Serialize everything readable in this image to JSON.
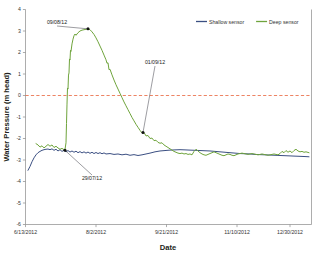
{
  "chart_data": {
    "type": "line",
    "title": "",
    "xlabel": "Date",
    "ylabel": "Water Pressure (m head)",
    "xlim": [
      "6/13/2012",
      "1/18/2013"
    ],
    "ylim": [
      -6,
      4
    ],
    "ytick_step": 1,
    "grid": false,
    "legend_position": "top-right",
    "x_ticks": [
      "6/13/2012",
      "8/2/2012",
      "9/21/2012",
      "11/10/2012",
      "12/30/2012"
    ],
    "y_ticks": [
      "4",
      "3",
      "2",
      "1",
      "0",
      "-1",
      "-2",
      "-3",
      "-4",
      "-5",
      "-6"
    ],
    "reference_lines": [
      {
        "name": "zero-line",
        "axis": "y",
        "value": 0,
        "style": "dashed",
        "color": "#e8643c"
      }
    ],
    "series": [
      {
        "name": "Shallow sensor",
        "color": "#3b4f82",
        "points": [
          [
            28,
            -3.48
          ],
          [
            30,
            -3.3
          ],
          [
            32,
            -3.08
          ],
          [
            34,
            -2.9
          ],
          [
            36,
            -2.76
          ],
          [
            38,
            -2.66
          ],
          [
            40,
            -2.6
          ],
          [
            42,
            -2.55
          ],
          [
            44,
            -2.52
          ],
          [
            46,
            -2.5
          ],
          [
            48,
            -2.49
          ],
          [
            50,
            -2.52
          ],
          [
            52,
            -2.48
          ],
          [
            54,
            -2.55
          ],
          [
            56,
            -2.5
          ],
          [
            58,
            -2.58
          ],
          [
            60,
            -2.52
          ],
          [
            62,
            -2.6
          ],
          [
            64,
            -2.55
          ],
          [
            66,
            -2.62
          ],
          [
            68,
            -2.56
          ],
          [
            70,
            -2.63
          ],
          [
            72,
            -2.58
          ],
          [
            74,
            -2.64
          ],
          [
            76,
            -2.59
          ],
          [
            78,
            -2.66
          ],
          [
            80,
            -2.61
          ],
          [
            82,
            -2.67
          ],
          [
            84,
            -2.62
          ],
          [
            86,
            -2.68
          ],
          [
            88,
            -2.63
          ],
          [
            90,
            -2.69
          ],
          [
            92,
            -2.64
          ],
          [
            94,
            -2.7
          ],
          [
            96,
            -2.65
          ],
          [
            98,
            -2.7
          ],
          [
            100,
            -2.66
          ],
          [
            102,
            -2.71
          ],
          [
            104,
            -2.67
          ],
          [
            106,
            -2.72
          ],
          [
            110,
            -2.7
          ],
          [
            114,
            -2.74
          ],
          [
            118,
            -2.72
          ],
          [
            122,
            -2.76
          ],
          [
            126,
            -2.73
          ],
          [
            130,
            -2.78
          ],
          [
            134,
            -2.75
          ],
          [
            138,
            -2.79
          ],
          [
            142,
            -2.76
          ],
          [
            146,
            -2.72
          ],
          [
            150,
            -2.68
          ],
          [
            155,
            -2.62
          ],
          [
            160,
            -2.58
          ],
          [
            165,
            -2.56
          ],
          [
            170,
            -2.54
          ],
          [
            175,
            -2.53
          ],
          [
            180,
            -2.52
          ],
          [
            185,
            -2.53
          ],
          [
            190,
            -2.54
          ],
          [
            195,
            -2.55
          ],
          [
            200,
            -2.56
          ],
          [
            205,
            -2.57
          ],
          [
            210,
            -2.58
          ],
          [
            215,
            -2.6
          ],
          [
            220,
            -2.62
          ],
          [
            225,
            -2.64
          ],
          [
            230,
            -2.66
          ],
          [
            235,
            -2.68
          ],
          [
            240,
            -2.7
          ],
          [
            245,
            -2.71
          ],
          [
            250,
            -2.72
          ],
          [
            255,
            -2.74
          ],
          [
            260,
            -2.75
          ],
          [
            265,
            -2.76
          ],
          [
            270,
            -2.77
          ],
          [
            275,
            -2.78
          ],
          [
            280,
            -2.79
          ],
          [
            285,
            -2.8
          ],
          [
            290,
            -2.81
          ],
          [
            295,
            -2.82
          ],
          [
            300,
            -2.83
          ],
          [
            305,
            -2.84
          ],
          [
            309,
            -2.85
          ]
        ]
      },
      {
        "name": "Deep sensor",
        "color": "#6fa43c",
        "points": [
          [
            36,
            -2.24
          ],
          [
            38,
            -2.3
          ],
          [
            40,
            -2.4
          ],
          [
            42,
            -2.34
          ],
          [
            44,
            -2.44
          ],
          [
            46,
            -2.36
          ],
          [
            48,
            -2.28
          ],
          [
            50,
            -2.36
          ],
          [
            52,
            -2.3
          ],
          [
            54,
            -2.42
          ],
          [
            56,
            -2.36
          ],
          [
            58,
            -2.44
          ],
          [
            60,
            -2.5
          ],
          [
            62,
            -2.46
          ],
          [
            64,
            -2.52
          ],
          [
            65,
            -2.5
          ],
          [
            66,
            -2.2
          ],
          [
            66.5,
            -1.3
          ],
          [
            67,
            -0.4
          ],
          [
            67.5,
            0.35
          ],
          [
            68,
            0.3
          ],
          [
            68.5,
            0.95
          ],
          [
            69,
            1.05
          ],
          [
            69.5,
            1.7
          ],
          [
            70,
            1.65
          ],
          [
            70.5,
            2.1
          ],
          [
            71,
            2.05
          ],
          [
            72,
            2.4
          ],
          [
            73,
            2.62
          ],
          [
            74,
            2.78
          ],
          [
            75,
            2.86
          ],
          [
            76,
            2.8
          ],
          [
            78,
            2.92
          ],
          [
            80,
            3.0
          ],
          [
            82,
            3.04
          ],
          [
            84,
            3.06
          ],
          [
            86,
            3.08
          ],
          [
            88,
            3.1
          ],
          [
            90,
            3.06
          ],
          [
            92,
            2.96
          ],
          [
            94,
            2.84
          ],
          [
            96,
            2.68
          ],
          [
            98,
            2.5
          ],
          [
            100,
            2.3
          ],
          [
            102,
            2.1
          ],
          [
            104,
            1.88
          ],
          [
            106,
            1.66
          ],
          [
            107,
            1.5
          ],
          [
            108,
            1.52
          ],
          [
            109,
            1.2
          ],
          [
            110,
            1.22
          ],
          [
            112,
            0.96
          ],
          [
            114,
            0.72
          ],
          [
            116,
            0.5
          ],
          [
            118,
            0.3
          ],
          [
            120,
            0.1
          ],
          [
            122,
            -0.1
          ],
          [
            124,
            -0.3
          ],
          [
            126,
            -0.48
          ],
          [
            128,
            -0.66
          ],
          [
            130,
            -0.84
          ],
          [
            132,
            -1.02
          ],
          [
            134,
            -1.18
          ],
          [
            136,
            -1.34
          ],
          [
            138,
            -1.48
          ],
          [
            140,
            -1.62
          ],
          [
            142,
            -1.74
          ],
          [
            144,
            -1.72
          ],
          [
            146,
            -1.88
          ],
          [
            148,
            -1.86
          ],
          [
            150,
            -2.0
          ],
          [
            152,
            -1.98
          ],
          [
            154,
            -2.1
          ],
          [
            156,
            -2.08
          ],
          [
            158,
            -2.18
          ],
          [
            160,
            -2.22
          ],
          [
            162,
            -2.2
          ],
          [
            164,
            -2.3
          ],
          [
            166,
            -2.36
          ],
          [
            168,
            -2.42
          ],
          [
            170,
            -2.48
          ],
          [
            172,
            -2.54
          ],
          [
            174,
            -2.6
          ],
          [
            176,
            -2.64
          ],
          [
            178,
            -2.68
          ],
          [
            180,
            -2.7
          ],
          [
            182,
            -2.68
          ],
          [
            184,
            -2.72
          ],
          [
            186,
            -2.7
          ],
          [
            188,
            -2.74
          ],
          [
            190,
            -2.72
          ],
          [
            192,
            -2.76
          ],
          [
            194,
            -2.6
          ],
          [
            196,
            -2.5
          ],
          [
            198,
            -2.58
          ],
          [
            200,
            -2.66
          ],
          [
            202,
            -2.72
          ],
          [
            204,
            -2.76
          ],
          [
            206,
            -2.78
          ],
          [
            208,
            -2.74
          ],
          [
            210,
            -2.7
          ],
          [
            212,
            -2.66
          ],
          [
            214,
            -2.62
          ],
          [
            216,
            -2.66
          ],
          [
            218,
            -2.7
          ],
          [
            220,
            -2.74
          ],
          [
            222,
            -2.78
          ],
          [
            224,
            -2.8
          ],
          [
            226,
            -2.76
          ],
          [
            228,
            -2.72
          ],
          [
            230,
            -2.74
          ],
          [
            232,
            -2.78
          ],
          [
            234,
            -2.8
          ],
          [
            236,
            -2.76
          ],
          [
            238,
            -2.72
          ],
          [
            240,
            -2.7
          ],
          [
            242,
            -2.68
          ],
          [
            244,
            -2.7
          ],
          [
            246,
            -2.72
          ],
          [
            248,
            -2.74
          ],
          [
            250,
            -2.72
          ],
          [
            252,
            -2.7
          ],
          [
            254,
            -2.72
          ],
          [
            256,
            -2.74
          ],
          [
            258,
            -2.76
          ],
          [
            260,
            -2.74
          ],
          [
            262,
            -2.72
          ],
          [
            264,
            -2.74
          ],
          [
            266,
            -2.76
          ],
          [
            268,
            -2.78
          ],
          [
            270,
            -2.76
          ],
          [
            272,
            -2.74
          ],
          [
            274,
            -2.72
          ],
          [
            276,
            -2.74
          ],
          [
            278,
            -2.76
          ],
          [
            280,
            -2.7
          ],
          [
            282,
            -2.6
          ],
          [
            284,
            -2.66
          ],
          [
            286,
            -2.56
          ],
          [
            288,
            -2.64
          ],
          [
            290,
            -2.58
          ],
          [
            292,
            -2.66
          ],
          [
            294,
            -2.56
          ],
          [
            296,
            -2.5
          ],
          [
            298,
            -2.58
          ],
          [
            300,
            -2.62
          ],
          [
            302,
            -2.6
          ],
          [
            304,
            -2.64
          ],
          [
            306,
            -2.62
          ],
          [
            309,
            -2.66
          ]
        ]
      }
    ],
    "annotations": [
      {
        "name": "annotation-peak",
        "label": "09/08/12",
        "text_x": 57,
        "text_y": 24,
        "point_x": 88,
        "point_y": 3.1
      },
      {
        "name": "annotation-recession",
        "label": "01/09/12",
        "text_x": 155,
        "text_y": 64,
        "point_x": 143,
        "point_y": -1.72
      },
      {
        "name": "annotation-onset",
        "label": "29/07/12",
        "text_x": 92,
        "text_y": 180,
        "point_x": 65,
        "point_y": -2.55
      }
    ]
  },
  "legend": {
    "items": [
      {
        "label": "Shallow sensor",
        "color": "#3b4f82"
      },
      {
        "label": "Deep sensor",
        "color": "#6fa43c"
      }
    ]
  }
}
